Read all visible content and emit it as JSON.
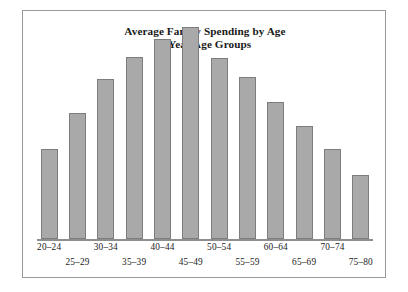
{
  "chart_data": {
    "type": "bar",
    "title": "Average Family Spending by Age",
    "subtitle": "5-Year Age Groups",
    "xlabel": "",
    "ylabel": "",
    "grid": false,
    "legend": false,
    "axis_y_visible": false,
    "axis_x_visible": true,
    "ylim": [
      0,
      190
    ],
    "categories": [
      "20–24",
      "25–29",
      "30–34",
      "35–39",
      "40–44",
      "45–49",
      "50–54",
      "55–59",
      "60–64",
      "65–69",
      "70–74",
      "75–80"
    ],
    "values": [
      75,
      105,
      133,
      152,
      167,
      177,
      151,
      135,
      114,
      94,
      75,
      53
    ],
    "label_rows": [
      0,
      1,
      0,
      1,
      0,
      1,
      0,
      1,
      0,
      1,
      0,
      1
    ],
    "colors": {
      "bar_fill": "#a9a9a9",
      "bar_edge": "#7d7d7d",
      "axis": "#8e8e8e",
      "frame": "#9a9a9a",
      "text": "#1a1a1a",
      "background": "#ffffff"
    }
  }
}
